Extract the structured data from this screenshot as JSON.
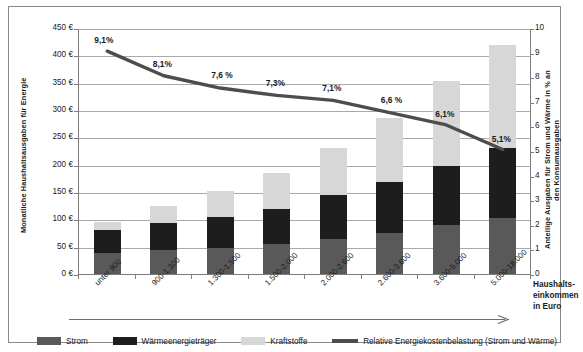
{
  "chart_data": {
    "type": "bar",
    "title": "",
    "subtitle": "",
    "xlabel": "Haushalts-einkommen in Euro",
    "ylabel": "Monatliche Haushaltsausgaben für Energie",
    "ylabel_right": "Anteilige Ausgaben für Strom und Wärme in % an den Konsumausgaben",
    "categories": [
      "unter 900",
      "900-1.300",
      "1.300-1.500",
      "1.500-2.000",
      "2.000-2.600",
      "2.600-3.600",
      "3.600-5.000",
      "5.000-18.000"
    ],
    "ylim": [
      0,
      450
    ],
    "ylim_right": [
      0,
      10
    ],
    "yticks": [
      "0 €",
      "50 €",
      "100 €",
      "150 €",
      "200 €",
      "250 €",
      "300 €",
      "350 €",
      "400 €",
      "450 €"
    ],
    "yticks_right": [
      "0",
      "1",
      "2",
      "3",
      "4",
      "5",
      "6",
      "7",
      "8",
      "9",
      "10"
    ],
    "grid": true,
    "legend_position": "bottom",
    "series": [
      {
        "name": "Strom",
        "color": "#595959",
        "values": [
          38,
          43,
          47,
          54,
          64,
          75,
          90,
          103
        ]
      },
      {
        "name": "Wärmeenergieträger",
        "color": "#1d1d1d",
        "values": [
          42,
          50,
          58,
          65,
          81,
          94,
          108,
          127
        ]
      },
      {
        "name": "Kraftstoffe",
        "color": "#d7d7d7",
        "values": [
          16,
          32,
          46,
          65,
          86,
          117,
          155,
          188
        ]
      },
      {
        "name": "Relative Energiekostenbelastung (Strom und Wärme)",
        "color": "#4d4d4d",
        "type": "line",
        "axis": "right",
        "values": [
          9.1,
          8.1,
          7.6,
          7.3,
          7.1,
          6.6,
          6.1,
          5.1
        ],
        "labels": [
          "9,1%",
          "8,1%",
          "7,6 %",
          "7,3%",
          "7,1%",
          "6,6 %",
          "6,1%",
          "5,1%"
        ]
      }
    ]
  },
  "axis": {
    "left_title": "Monatliche Haushaltsausgaben für Energie",
    "right_title": "Anteilige Ausgaben für Strom und Wärme in % an den Konsumausgaben",
    "x_caption_line1": "Haushalts-",
    "x_caption_line2": "einkommen",
    "x_caption_line3": "in Euro"
  },
  "legend": {
    "items": [
      {
        "label": "Strom",
        "swatch": "swatch-strom"
      },
      {
        "label": "Wärmeenergieträger",
        "swatch": "swatch-waermeenergietraeger"
      },
      {
        "label": "Kraftstoffe",
        "swatch": "swatch-kraftstoffe"
      },
      {
        "label": "Relative Energiekostenbelastung (Strom und Wärme)",
        "swatch": "swatch-line"
      }
    ]
  },
  "colors": {
    "strom": "#595959",
    "waerme": "#1d1d1d",
    "kraftstoffe": "#d7d7d7",
    "line": "#4d4d4d",
    "grid": "#a9a9a9",
    "axis": "#7d7d7d",
    "frame": "#8a8a8a"
  }
}
